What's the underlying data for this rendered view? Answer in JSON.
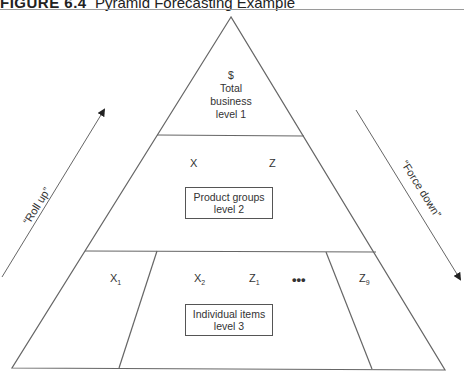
{
  "figure": {
    "number": "FIGURE 6.4",
    "title": "Pyramid Forecasting Example"
  },
  "levels": [
    {
      "lines": [
        "$",
        "Total",
        "business",
        "level 1"
      ]
    },
    {
      "items": [
        "X",
        "Z"
      ],
      "box_line1": "Product groups",
      "box_line2": "level 2"
    },
    {
      "items": [
        {
          "base": "X",
          "sub": "1"
        },
        {
          "base": "X",
          "sub": "2"
        },
        {
          "base": "Z",
          "sub": "1"
        },
        {
          "base": "•••",
          "sub": ""
        },
        {
          "base": "Z",
          "sub": "9"
        }
      ],
      "box_line1": "Individual items",
      "box_line2": "level 3"
    }
  ],
  "arrows": {
    "left": "“Roll up”",
    "right": "“Force down”"
  },
  "colors": {
    "line": "#666666",
    "text": "#333333"
  }
}
